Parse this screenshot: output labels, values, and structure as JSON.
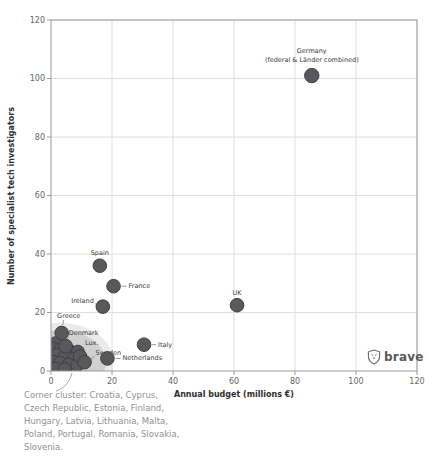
{
  "figure": {
    "watermark": "brave"
  },
  "chart_data": {
    "type": "scatter",
    "title": "",
    "xlabel": "Annual budget (millions €)",
    "ylabel": "Number of specialist tech investigators",
    "xlim": [
      0,
      120
    ],
    "ylim": [
      0,
      120
    ],
    "x_ticks": [
      0,
      20,
      40,
      60,
      80,
      100,
      120
    ],
    "y_ticks": [
      0,
      20,
      40,
      60,
      80,
      100,
      120
    ],
    "grid": true,
    "legend": "none",
    "points": [
      {
        "name": "Germany",
        "x": 85.5,
        "y": 101,
        "r": 7.2,
        "label_lines": [
          "Germany",
          "(federal & Länder combined)"
        ],
        "anchor": "middle",
        "dx": 0,
        "dy": -23,
        "line_gap": 9,
        "leader": null
      },
      {
        "name": "UK",
        "x": 61,
        "y": 22.5,
        "r": 6.8,
        "label_lines": [
          "UK"
        ],
        "anchor": "middle",
        "dx": 0,
        "dy": -10,
        "leader": null
      },
      {
        "name": "Spain",
        "x": 16,
        "y": 36,
        "r": 6.8,
        "label_lines": [
          "Spain"
        ],
        "anchor": "middle",
        "dx": 0,
        "dy": -11,
        "leader": null
      },
      {
        "name": "France",
        "x": 20.5,
        "y": 29,
        "r": 6.8,
        "label_lines": [
          "France"
        ],
        "anchor": "start",
        "dx": 15,
        "dy": 2,
        "leader": [
          8,
          0,
          13,
          0
        ]
      },
      {
        "name": "Ireland",
        "x": 17,
        "y": 22,
        "r": 6.8,
        "label_lines": [
          "Ireland"
        ],
        "anchor": "end",
        "dx": -9,
        "dy": -4,
        "leader": [
          -8,
          -3,
          -4,
          -1
        ]
      },
      {
        "name": "Greece",
        "x": 3.5,
        "y": 13,
        "r": 6.8,
        "label_lines": [
          "Greece"
        ],
        "anchor": "middle",
        "dx": 7,
        "dy": -15,
        "leader": [
          2,
          -13,
          1,
          -8
        ]
      },
      {
        "name": "Denmark",
        "x": 4.8,
        "y": 8.5,
        "r": 6.8,
        "label_lines": [
          "Denmark"
        ],
        "anchor": "start",
        "dx": 3,
        "dy": -11,
        "leader": [
          3,
          -9,
          1,
          -7
        ]
      },
      {
        "name": "Lux.",
        "x": 9.5,
        "y": 5,
        "r": 6.8,
        "label_lines": [
          "Lux."
        ],
        "anchor": "start",
        "dx": 5,
        "dy": -11,
        "leader": [
          4,
          -9,
          1,
          -7
        ]
      },
      {
        "name": "Sweden",
        "x": 11,
        "y": 3,
        "r": 6.8,
        "label_lines": [
          "Sweden"
        ],
        "anchor": "start",
        "dx": 11,
        "dy": -7,
        "leader": [
          10,
          -6,
          5,
          -2
        ]
      },
      {
        "name": "Netherlands",
        "x": 18.5,
        "y": 4.3,
        "r": 6.8,
        "label_lines": [
          "Netherlands"
        ],
        "anchor": "start",
        "dx": 15,
        "dy": 2,
        "leader": [
          8,
          0,
          13,
          0
        ]
      },
      {
        "name": "Italy",
        "x": 30.5,
        "y": 9,
        "r": 6.8,
        "label_lines": [
          "Italy"
        ],
        "anchor": "start",
        "dx": 14,
        "dy": 2,
        "leader": [
          8,
          0,
          12,
          0
        ]
      }
    ],
    "corner_cluster": {
      "countries": [
        "Croatia",
        "Cyprus",
        "Czech Republic",
        "Estonia",
        "Finland",
        "Hungary",
        "Latvia",
        "Lithuania",
        "Malta",
        "Poland",
        "Portugal",
        "Romania",
        "Slovakia",
        "Slovenia"
      ],
      "dots": [
        [
          1.5,
          9.5
        ],
        [
          0.3,
          7.8
        ],
        [
          3.2,
          7.5
        ],
        [
          6.2,
          6.8
        ],
        [
          8.8,
          6.6
        ],
        [
          1.8,
          5.5
        ],
        [
          4.6,
          5.0
        ],
        [
          7.5,
          4.2
        ],
        [
          0.5,
          3.2
        ],
        [
          3.0,
          2.8
        ],
        [
          5.8,
          2.2
        ],
        [
          8.6,
          2.0
        ],
        [
          1.5,
          0.8
        ],
        [
          4.5,
          0.6
        ]
      ],
      "blob": {
        "cx": 3,
        "cy": 3,
        "rx_units": 15,
        "ry_units": 11
      },
      "halo": {
        "rx_units": 17.5,
        "ry_units": 13.5
      }
    },
    "annotation": {
      "lines": [
        "Corner cluster: Croatia, Cyprus,",
        "Czech Republic, Estonia, Finland,",
        "Hungary, Latvia, Lithuania, Malta,",
        "Poland, Portugal, Romania, Slovakia,",
        "Slovenia."
      ]
    }
  },
  "style": {
    "dot_fill": "#59595c",
    "dot_stroke": "#404043",
    "blob_fill": "#c9c9c9",
    "halo_fill": "#d9d9d9",
    "grid_color": "#dedede",
    "axis_color": "#9b9b9b",
    "tick_text": "#666666",
    "label_text": "#3a3a3a",
    "leader_color": "#6f6f6f"
  }
}
